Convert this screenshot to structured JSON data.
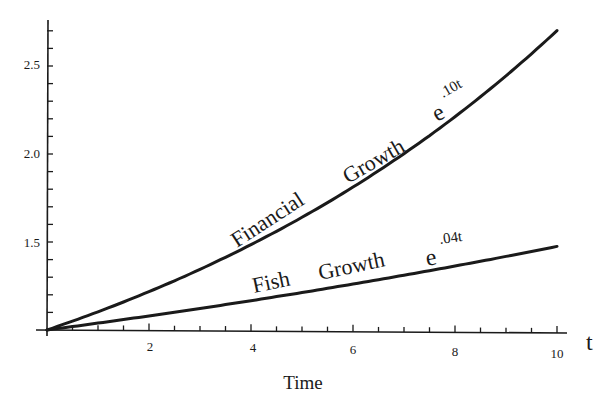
{
  "chart_data": {
    "type": "line",
    "title": "",
    "xlabel": "Time",
    "xaxis_variable": "t",
    "ylabel": "",
    "xlim": [
      0,
      10
    ],
    "ylim": [
      1.0,
      2.75
    ],
    "x_ticks": [
      2,
      4,
      6,
      8,
      10
    ],
    "x_tick_labels": [
      "2",
      "4",
      "6",
      "8",
      "10"
    ],
    "x_minor_step": 0.5,
    "y_ticks": [
      1.5,
      2.0,
      2.5
    ],
    "y_tick_labels": [
      "1.5",
      "2.0",
      "2.5"
    ],
    "y_minor_step": 0.1,
    "grid": false,
    "legend": "none (inline curve labels)",
    "x": [
      0,
      1,
      2,
      3,
      4,
      5,
      6,
      7,
      8,
      9,
      10
    ],
    "series": [
      {
        "name": "Financial Growth",
        "formula_base": "e",
        "formula_exponent": ".10t",
        "values": [
          1.0,
          1.105,
          1.221,
          1.35,
          1.492,
          1.649,
          1.822,
          2.014,
          2.226,
          2.46,
          2.718
        ]
      },
      {
        "name": "Fish Growth",
        "formula_base": "e",
        "formula_exponent": ".04t",
        "values": [
          1.0,
          1.041,
          1.083,
          1.127,
          1.174,
          1.221,
          1.271,
          1.323,
          1.377,
          1.433,
          1.492
        ]
      }
    ],
    "annotations": [
      {
        "text": "Financial Growth",
        "formula": "e^.10t",
        "position": "along upper curve"
      },
      {
        "text": "Fish Growth",
        "formula": "e^.04t",
        "position": "along lower curve"
      }
    ]
  },
  "labels": {
    "x_axis_title": "Time",
    "t_symbol": "t",
    "financial_label": "Financial",
    "financial_label2": "Growth",
    "financial_exp_base": "e",
    "financial_exp_sup": ".10t",
    "fish_label": "Fish",
    "fish_label2": "Growth",
    "fish_exp_base": "e",
    "fish_exp_sup": ".04t",
    "x_tick_2": "2",
    "x_tick_4": "4",
    "x_tick_6": "6",
    "x_tick_8": "8",
    "x_tick_10": "10",
    "y_tick_15": "1.5",
    "y_tick_20": "2.0",
    "y_tick_25": "2.5"
  },
  "colors": {
    "ink": "#1a1a1a",
    "background": "#ffffff"
  }
}
